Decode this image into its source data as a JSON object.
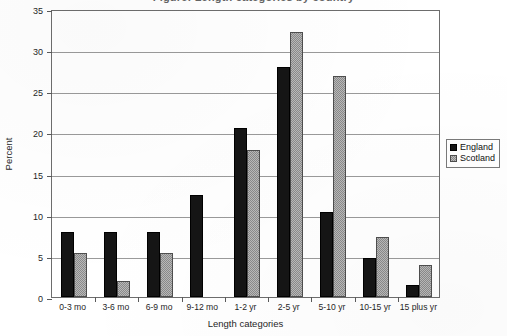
{
  "title_cropped": "Figure: Length categories by country",
  "chart_data": {
    "type": "bar",
    "title": "",
    "xlabel": "Length categories",
    "ylabel": "Percent",
    "ylim": [
      0,
      35
    ],
    "ytick_step": 5,
    "yticks": [
      "0",
      "5",
      "10",
      "15",
      "20",
      "25",
      "30",
      "35"
    ],
    "grid": true,
    "legend_position": "right-outside",
    "categories": [
      "0-3 mo",
      "3-6 mo",
      "6-9 mo",
      "9-12 mo",
      "1-2 yr",
      "2-5 yr",
      "5-10 yr",
      "10-15 yr",
      "15 plus yr"
    ],
    "series": [
      {
        "name": "England",
        "color": "#151515",
        "fill": "solid-black",
        "values": [
          7.9,
          7.9,
          7.9,
          12.4,
          20.6,
          28.0,
          10.3,
          4.7,
          1.4
        ]
      },
      {
        "name": "Scotland",
        "color": "#b9b9b9",
        "fill": "gray-dotted-hatch",
        "values": [
          5.4,
          2.0,
          5.4,
          0,
          17.9,
          32.2,
          26.8,
          7.3,
          3.9
        ]
      }
    ]
  }
}
